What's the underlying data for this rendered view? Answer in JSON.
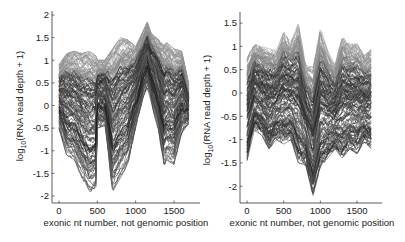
{
  "chart_data": [
    {
      "type": "line",
      "title": "",
      "xlabel": "exonic nt number, not genomic position",
      "ylabel": "log10(RNA read depth + 1)",
      "ylabel_parts": {
        "pre": "log",
        "sub": "10",
        "post": "(RNA read depth + 1)"
      },
      "xlim": [
        -80,
        1850
      ],
      "ylim": [
        -2.1,
        2.1
      ],
      "xticks": [
        0,
        500,
        1000,
        1500
      ],
      "yticks": [
        -2,
        -1.5,
        -1,
        -0.5,
        0,
        0.5,
        1,
        1.5,
        2
      ],
      "grid": false,
      "legend": "none",
      "series_count_approx": 150,
      "x_range_data": [
        0,
        1700
      ],
      "envelope": {
        "x": [
          0,
          100,
          200,
          300,
          400,
          480,
          500,
          600,
          700,
          800,
          900,
          1000,
          1100,
          1150,
          1200,
          1300,
          1370,
          1400,
          1500,
          1600,
          1700
        ],
        "upper": [
          0.9,
          1.15,
          1.2,
          1.15,
          1.2,
          1.1,
          1.0,
          1.0,
          1.25,
          1.5,
          1.45,
          1.3,
          1.65,
          1.85,
          1.6,
          1.45,
          1.35,
          1.4,
          1.25,
          1.2,
          0.4
        ],
        "lower": [
          -0.5,
          -1.1,
          -1.2,
          -1.6,
          -1.95,
          -1.8,
          -0.5,
          -0.45,
          -1.9,
          -1.6,
          -1.3,
          -0.5,
          0.2,
          0.4,
          0.1,
          -0.6,
          -1.35,
          -1.2,
          -1.3,
          -0.6,
          -0.4
        ]
      }
    },
    {
      "type": "line",
      "title": "",
      "xlabel": "exonic nt number, not genomic position",
      "ylabel": "log10(RNA read depth + 1)",
      "ylabel_parts": {
        "pre": "log",
        "sub": "10",
        "post": "(RNA read depth + 1)"
      },
      "xlim": [
        -80,
        1850
      ],
      "ylim": [
        -2.45,
        1.8
      ],
      "xticks": [
        0,
        500,
        1000,
        1500
      ],
      "yticks": [
        -2,
        -1.5,
        -1,
        -0.5,
        0,
        0.5,
        1,
        1.5
      ],
      "grid": false,
      "legend": "none",
      "series_count_approx": 150,
      "x_range_data": [
        0,
        1700
      ],
      "envelope": {
        "x": [
          0,
          100,
          200,
          300,
          400,
          500,
          600,
          700,
          800,
          900,
          1000,
          1100,
          1200,
          1300,
          1400,
          1500,
          1600,
          1700
        ],
        "upper": [
          0.75,
          1.05,
          1.0,
          0.95,
          0.9,
          1.3,
          1.1,
          1.5,
          0.6,
          0.55,
          1.4,
          0.9,
          0.6,
          1.25,
          1.05,
          1.05,
          0.8,
          0.95
        ],
        "lower": [
          -1.45,
          -0.8,
          -0.9,
          -1.2,
          -1.0,
          -1.1,
          -1.0,
          -1.5,
          -1.55,
          -2.2,
          -1.6,
          -1.4,
          -1.2,
          -1.4,
          -1.2,
          -1.3,
          -1.05,
          -1.2
        ]
      }
    }
  ]
}
